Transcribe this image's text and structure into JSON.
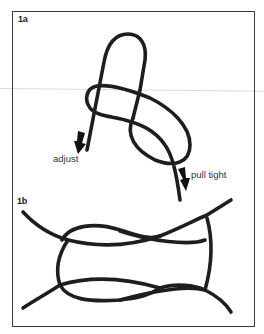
{
  "figure": {
    "panels": [
      {
        "label": "1a",
        "annotations": [
          {
            "text": "adjust",
            "arrow": "down"
          },
          {
            "text": "pull tight",
            "arrow": "down"
          }
        ]
      },
      {
        "label": "1b",
        "annotations": []
      }
    ],
    "colors": {
      "rope": "#1e1e1e",
      "frame": "#3a3a3a",
      "background": "#ffffff"
    }
  }
}
